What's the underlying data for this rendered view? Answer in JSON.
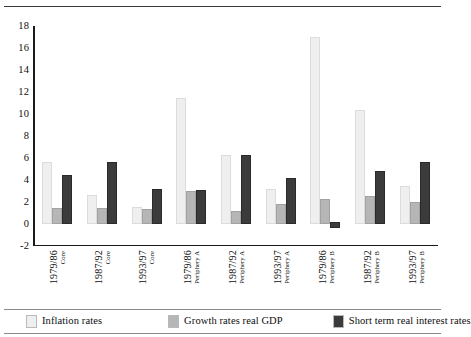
{
  "chart_data": {
    "type": "bar",
    "title": "",
    "xlabel": "",
    "ylabel": "",
    "ylim": [
      -2,
      18
    ],
    "ytick_step": 2,
    "grid": false,
    "legend_position": "bottom",
    "yticks": [
      "18",
      "16",
      "14",
      "12",
      "10",
      "8",
      "6",
      "4",
      "2",
      "0",
      "-2"
    ],
    "categories": [
      {
        "period": "1979/86",
        "region": "Core"
      },
      {
        "period": "1987/92",
        "region": "Core"
      },
      {
        "period": "1993/97",
        "region": "Core"
      },
      {
        "period": "1979/86",
        "region": "Periphery A"
      },
      {
        "period": "1987/92",
        "region": "Periphery A"
      },
      {
        "period": "1993/97",
        "region": "Periphery A"
      },
      {
        "period": "1979/86",
        "region": "Periphery B"
      },
      {
        "period": "1987/92",
        "region": "Periphery B"
      },
      {
        "period": "1993/97",
        "region": "Periphery B"
      }
    ],
    "series": [
      {
        "name": "Inflation rates",
        "color": "#efefef",
        "values": [
          5.5,
          2.5,
          1.4,
          11.3,
          6.1,
          3.0,
          16.8,
          10.2,
          3.3
        ]
      },
      {
        "name": "Growth rates real GDP",
        "color": "#b6b6b6",
        "values": [
          1.3,
          1.3,
          1.2,
          2.8,
          1.0,
          1.6,
          2.1,
          2.4,
          1.8
        ]
      },
      {
        "name": "Short term real interest rates",
        "color": "#3b3b3b",
        "values": [
          4.3,
          5.5,
          3.0,
          2.9,
          6.1,
          4.0,
          -0.4,
          4.6,
          5.5
        ]
      }
    ]
  }
}
